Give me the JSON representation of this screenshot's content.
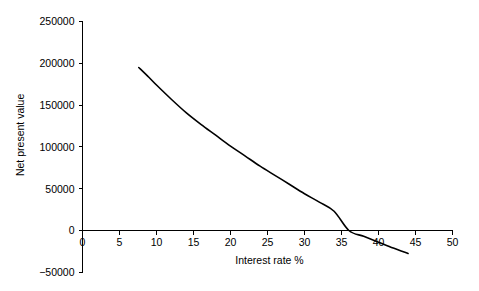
{
  "chart_data": {
    "type": "line",
    "title": "",
    "xlabel": "Interest rate %",
    "ylabel": "Net present value",
    "xlim": [
      0,
      50
    ],
    "ylim": [
      -50000,
      250000
    ],
    "grid": false,
    "legend": null,
    "xticks": [
      0,
      5,
      10,
      15,
      20,
      25,
      30,
      35,
      40,
      45,
      50
    ],
    "xtick_labels": [
      "0",
      "5",
      "10",
      "15",
      "20",
      "25",
      "30",
      "35",
      "40",
      "45",
      "50"
    ],
    "yticks": [
      -50000,
      0,
      50000,
      100000,
      150000,
      200000,
      250000
    ],
    "ytick_labels": [
      "-50000",
      "0",
      "50000",
      "100000",
      "150000",
      "200000",
      "250000"
    ],
    "series": [
      {
        "name": "Net present value",
        "color": "#000000",
        "x": [
          7.6,
          9,
          10,
          12,
          14,
          16,
          18,
          20,
          22,
          24,
          26,
          28,
          30,
          32,
          34,
          36,
          38,
          40,
          42,
          44
        ],
        "values": [
          195000,
          183000,
          174000,
          157000,
          141000,
          127000,
          114000,
          101000,
          89000,
          77000,
          66000,
          55000,
          44000,
          34000,
          23000,
          0,
          -7000,
          -14000,
          -21000,
          -27500
        ]
      }
    ],
    "annotations": [
      {
        "label": "zero-crossing",
        "x": 36,
        "y": 0
      }
    ]
  },
  "axes": {
    "y_title": "Net present value",
    "x_title": "Interest rate %"
  }
}
